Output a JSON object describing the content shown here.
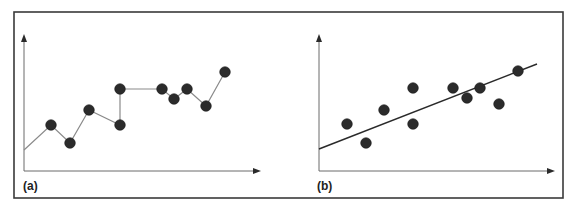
{
  "colors": {
    "frame": "#3a3a3a",
    "axis": "#6a6a6a",
    "marker": "#2b2b2b",
    "series_line": "#8a8a8a",
    "trend_line": "#2a2a2a",
    "background": "#ffffff"
  },
  "panels": [
    {
      "id": "a",
      "label": "(a)"
    },
    {
      "id": "b",
      "label": "(b)"
    }
  ],
  "chart_data": [
    {
      "type": "line",
      "panel_label": "(a)",
      "title": "",
      "xlabel": "",
      "ylabel": "",
      "grid": false,
      "legend": null,
      "ticks": false,
      "description": "Connected line through every point (overfit curve)",
      "line_start": [
        0,
        0.15
      ],
      "x": [
        1,
        2,
        3,
        4,
        4,
        5,
        5.5,
        6,
        7,
        8
      ],
      "y": [
        0.35,
        0.2,
        0.45,
        0.35,
        0.62,
        0.62,
        0.54,
        0.62,
        0.5,
        0.75
      ],
      "points_px": [
        [
          51,
          125
        ],
        [
          70,
          143
        ],
        [
          89,
          110
        ],
        [
          120,
          125
        ],
        [
          120,
          89
        ],
        [
          162,
          89
        ],
        [
          174,
          99
        ],
        [
          187,
          89
        ],
        [
          206,
          106
        ],
        [
          225,
          72
        ]
      ],
      "line_start_px": [
        24,
        150
      ]
    },
    {
      "type": "scatter",
      "panel_label": "(b)",
      "title": "",
      "xlabel": "",
      "ylabel": "",
      "grid": false,
      "legend": null,
      "ticks": false,
      "description": "Same scatter points with a straight linear fit line",
      "x": [
        1,
        2,
        3,
        4.5,
        4.5,
        6.5,
        7.2,
        7.9,
        8.9,
        9.9
      ],
      "y": [
        0.35,
        0.2,
        0.45,
        0.62,
        0.35,
        0.62,
        0.54,
        0.62,
        0.5,
        0.75
      ],
      "points_px": [
        [
          347,
          124
        ],
        [
          366,
          143
        ],
        [
          384,
          110
        ],
        [
          413,
          88
        ],
        [
          413,
          124
        ],
        [
          453,
          88
        ],
        [
          467,
          98
        ],
        [
          480,
          88
        ],
        [
          499,
          104
        ],
        [
          518,
          71
        ]
      ],
      "trend_line_px": [
        [
          319,
          149
        ],
        [
          537,
          64
        ]
      ]
    }
  ]
}
